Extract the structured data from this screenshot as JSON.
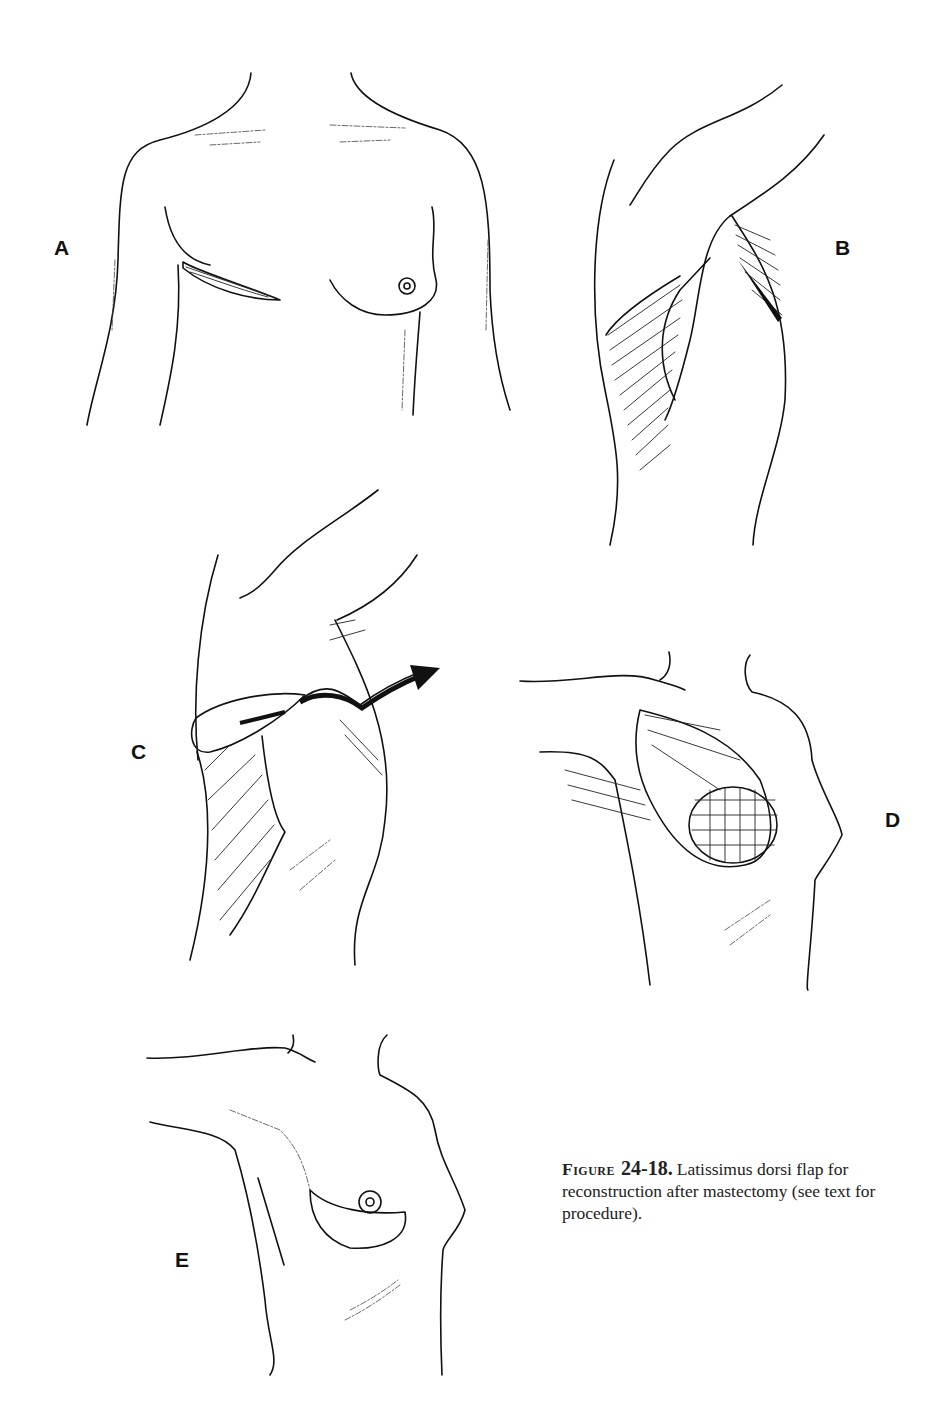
{
  "figure": {
    "panels": [
      {
        "id": "A",
        "label": "A",
        "description": "Anterior torso with elliptical incision on left chest (mastectomy site)"
      },
      {
        "id": "B",
        "label": "B",
        "description": "Lateral view of back/axilla showing latissimus dorsi muscle outline"
      },
      {
        "id": "C",
        "label": "C",
        "description": "Latissimus dorsi flap elevated and rotated anteriorly through axillary tunnel (arrow)"
      },
      {
        "id": "D",
        "label": "D",
        "description": "Flap positioned over implant on chest wall"
      },
      {
        "id": "E",
        "label": "E",
        "description": "Final reconstructed breast with skin paddle"
      }
    ],
    "caption": {
      "figure_word": "Figure",
      "figure_number": "24-18.",
      "text": "Latissimus dorsi flap for reconstruction after mastectomy (see text for procedure)."
    }
  }
}
